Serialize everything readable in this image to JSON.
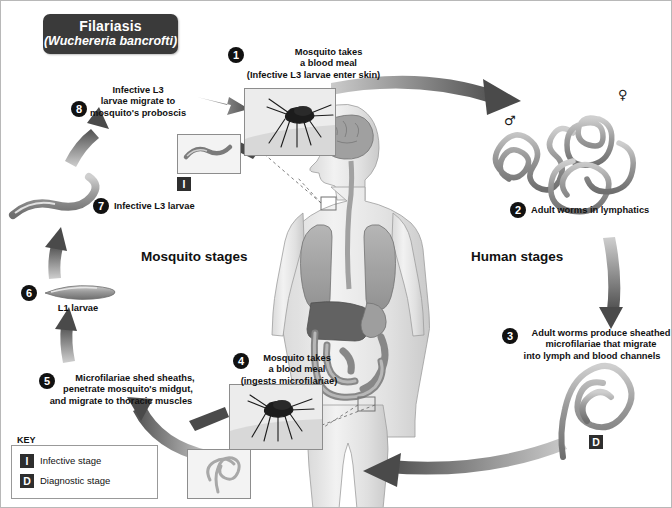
{
  "title": {
    "disease": "Filariasis",
    "species": "(Wuchereria bancrofti)"
  },
  "stage_labels": {
    "mosquito": "Mosquito stages",
    "human": "Human stages"
  },
  "steps": [
    {
      "number": "1",
      "lines": [
        "Mosquito takes",
        "a blood meal",
        "(Infective L3 larvae enter skin)"
      ]
    },
    {
      "number": "2",
      "lines": [
        "Adult worms in lymphatics"
      ]
    },
    {
      "number": "3",
      "lines": [
        "Adult worms produce sheathed",
        "microfilariae that migrate",
        "into lymph and blood channels"
      ]
    },
    {
      "number": "4",
      "lines": [
        "Mosquito takes",
        "a blood meal",
        "(ingests microfilariae)"
      ]
    },
    {
      "number": "5",
      "lines": [
        "Microfilariae shed sheaths,",
        "penetrate mosquito's midgut,",
        "and migrate to thoracic muscles"
      ]
    },
    {
      "number": "6",
      "lines": [
        "L1 larvae"
      ]
    },
    {
      "number": "7",
      "lines": [
        "Infective L3 larvae"
      ]
    },
    {
      "number": "8",
      "lines": [
        "Infective L3",
        "larvae migrate to",
        "mosquito's proboscis"
      ]
    }
  ],
  "badges": {
    "infective": "I",
    "diagnostic": "D"
  },
  "sex_symbols": {
    "male": "♂",
    "female": "♀"
  },
  "key": {
    "title": "KEY",
    "items": [
      {
        "symbol": "I",
        "label": "Infective stage"
      },
      {
        "symbol": "D",
        "label": "Diagnostic stage"
      }
    ]
  },
  "colors": {
    "banner_bg": "#3a3a3a",
    "badge_bg": "#2e2e2e",
    "arrow_dark": "#4a4a4a",
    "arrow_mid": "#8a8a8a",
    "text": "#111111"
  }
}
